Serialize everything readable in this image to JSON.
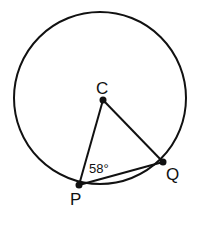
{
  "diagram": {
    "circle": {
      "cx": 100,
      "cy": 98,
      "r": 86
    },
    "points": {
      "C": {
        "label": "C",
        "x": 103,
        "y": 100
      },
      "P": {
        "label": "P",
        "x": 79,
        "y": 185
      },
      "Q": {
        "label": "Q",
        "x": 163,
        "y": 162
      }
    },
    "angle_label": "58°",
    "colors": {
      "stroke": "#111111",
      "background": "#ffffff"
    }
  }
}
